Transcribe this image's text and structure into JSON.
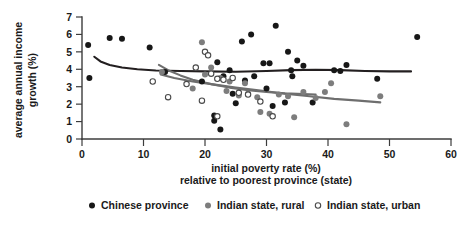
{
  "chart_data": {
    "type": "scatter",
    "title": "",
    "xlabel": "initial poverty rate (%) relative to poorest province (state)",
    "xlabel_line1": "initial poverty rate (%)",
    "xlabel_line2": "relative to poorest province (state)",
    "ylabel": "average annual income growth (%)",
    "ylabel_line1": "average annual income",
    "ylabel_line2": "growth (%)",
    "xlim": [
      0,
      60
    ],
    "ylim": [
      0,
      7
    ],
    "xticks": [
      0,
      10,
      20,
      30,
      40,
      50,
      60
    ],
    "yticks": [
      0,
      1,
      2,
      3,
      4,
      5,
      6,
      7
    ],
    "xtick_labels": [
      "0",
      "10",
      "20",
      "30",
      "40",
      "50",
      "60"
    ],
    "ytick_labels": [
      "0",
      "1",
      "2",
      "3",
      "4",
      "5",
      "6",
      "7"
    ],
    "grid": false,
    "legend_position": "below",
    "colors": {
      "chinese_province": "#171717",
      "indian_rural": "#7d7d7d",
      "indian_urban": "#ffffff",
      "indian_urban_edge": "#4a4a4a",
      "trend_chinese": "#231f20",
      "trend_indian": "#6e6e6e",
      "axis": "#3c3c3c"
    },
    "series": [
      {
        "name": "Chinese province",
        "marker": "filled-circle-black",
        "points": [
          [
            1.0,
            5.4
          ],
          [
            1.2,
            3.5
          ],
          [
            4.5,
            5.8
          ],
          [
            6.5,
            5.75
          ],
          [
            11.0,
            5.25
          ],
          [
            13.5,
            3.85
          ],
          [
            19.5,
            3.3
          ],
          [
            26.0,
            5.6
          ],
          [
            27.5,
            6.0
          ],
          [
            29.5,
            4.35
          ],
          [
            30.5,
            4.35
          ],
          [
            22.0,
            4.4
          ],
          [
            23.0,
            3.6
          ],
          [
            24.5,
            2.6
          ],
          [
            25.0,
            2.05
          ],
          [
            21.5,
            1.35
          ],
          [
            21.5,
            1.05
          ],
          [
            22.5,
            0.55
          ],
          [
            24.0,
            3.95
          ],
          [
            26.5,
            3.35
          ],
          [
            28.0,
            3.6
          ],
          [
            31.5,
            6.5
          ],
          [
            33.5,
            5.0
          ],
          [
            35.0,
            4.5
          ],
          [
            34.0,
            3.95
          ],
          [
            34.2,
            3.6
          ],
          [
            36.0,
            4.2
          ],
          [
            30.0,
            2.9
          ],
          [
            31.0,
            1.9
          ],
          [
            33.0,
            2.1
          ],
          [
            37.5,
            2.1
          ],
          [
            41.0,
            3.95
          ],
          [
            42.0,
            3.9
          ],
          [
            43.0,
            4.25
          ],
          [
            48.0,
            3.45
          ],
          [
            54.5,
            5.85
          ]
        ]
      },
      {
        "name": "Indian state, rural",
        "marker": "filled-circle-gray",
        "points": [
          [
            13.0,
            3.85
          ],
          [
            19.5,
            5.55
          ],
          [
            21.0,
            4.1
          ],
          [
            22.5,
            3.5
          ],
          [
            24.0,
            3.3
          ],
          [
            26.5,
            3.2
          ],
          [
            23.5,
            2.75
          ],
          [
            25.5,
            2.5
          ],
          [
            27.0,
            2.6
          ],
          [
            28.5,
            2.4
          ],
          [
            29.0,
            1.55
          ],
          [
            30.5,
            1.45
          ],
          [
            32.0,
            2.55
          ],
          [
            33.5,
            2.45
          ],
          [
            34.5,
            1.25
          ],
          [
            36.0,
            2.7
          ],
          [
            38.0,
            2.35
          ],
          [
            39.5,
            2.7
          ],
          [
            40.5,
            3.2
          ],
          [
            43.0,
            0.85
          ],
          [
            48.5,
            2.45
          ],
          [
            20.0,
            3.7
          ],
          [
            18.0,
            2.9
          ]
        ]
      },
      {
        "name": "Indian state, urban",
        "marker": "open-circle",
        "points": [
          [
            11.5,
            3.3
          ],
          [
            14.0,
            2.4
          ],
          [
            18.5,
            4.1
          ],
          [
            20.0,
            5.0
          ],
          [
            20.5,
            4.8
          ],
          [
            21.0,
            3.75
          ],
          [
            22.0,
            3.45
          ],
          [
            23.0,
            3.4
          ],
          [
            24.5,
            3.5
          ],
          [
            19.5,
            2.2
          ],
          [
            25.5,
            2.65
          ],
          [
            27.0,
            2.55
          ],
          [
            22.0,
            1.3
          ],
          [
            29.0,
            2.15
          ],
          [
            31.0,
            1.3
          ],
          [
            17.0,
            3.15
          ]
        ]
      }
    ],
    "trend_lines": [
      {
        "name": "Chinese province trend",
        "color": "#231f20",
        "points": [
          [
            2.0,
            4.72
          ],
          [
            3.0,
            4.45
          ],
          [
            4.5,
            4.25
          ],
          [
            6.5,
            4.1
          ],
          [
            9.0,
            4.0
          ],
          [
            12.0,
            3.93
          ],
          [
            16.0,
            3.9
          ],
          [
            20.0,
            3.88
          ],
          [
            25.0,
            3.86
          ],
          [
            30.0,
            3.9
          ],
          [
            34.0,
            3.95
          ],
          [
            38.0,
            3.97
          ],
          [
            42.0,
            3.95
          ],
          [
            46.0,
            3.9
          ],
          [
            50.0,
            3.88
          ],
          [
            53.5,
            3.88
          ]
        ]
      },
      {
        "name": "Indian state trend (upper)",
        "color": "#6e6e6e",
        "points": [
          [
            12.5,
            4.25
          ],
          [
            14.0,
            3.95
          ],
          [
            16.0,
            3.65
          ],
          [
            18.0,
            3.4
          ],
          [
            21.0,
            3.15
          ],
          [
            24.0,
            2.95
          ],
          [
            27.0,
            2.8
          ],
          [
            30.0,
            2.7
          ],
          [
            33.0,
            2.62
          ],
          [
            36.0,
            2.58
          ],
          [
            38.0,
            2.55
          ]
        ]
      },
      {
        "name": "Indian state trend (lower)",
        "color": "#6e6e6e",
        "points": [
          [
            12.8,
            3.7
          ],
          [
            15.0,
            3.5
          ],
          [
            18.0,
            3.3
          ],
          [
            21.0,
            3.15
          ],
          [
            25.0,
            2.95
          ],
          [
            29.0,
            2.78
          ],
          [
            33.0,
            2.6
          ],
          [
            37.0,
            2.45
          ],
          [
            41.0,
            2.3
          ],
          [
            45.0,
            2.2
          ],
          [
            48.5,
            2.1
          ]
        ]
      }
    ],
    "legend": [
      {
        "label": "Chinese province",
        "marker": "filled-circle-black"
      },
      {
        "label": "Indian state, rural",
        "marker": "filled-circle-gray"
      },
      {
        "label": "Indian state, urban",
        "marker": "open-circle"
      }
    ]
  }
}
